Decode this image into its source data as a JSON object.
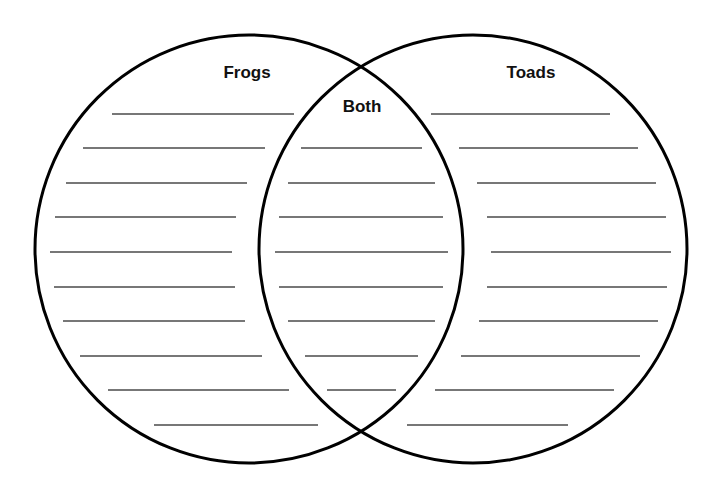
{
  "diagram": {
    "type": "venn",
    "sets": [
      {
        "id": "left",
        "label": "Frogs",
        "blank_lines": 10
      },
      {
        "id": "right",
        "label": "Toads",
        "blank_lines": 10
      }
    ],
    "intersection": {
      "label": "Both",
      "blank_lines": 8
    },
    "colors": {
      "outline": "#000000",
      "lines": "#4a4a4a",
      "background": "#ffffff"
    }
  }
}
